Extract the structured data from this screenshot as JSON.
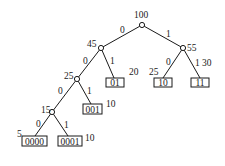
{
  "diagram": {
    "type": "huffman-tree",
    "nodes": [
      {
        "id": "root",
        "weight": "100"
      },
      {
        "id": "n45",
        "weight": "45"
      },
      {
        "id": "n55",
        "weight": "55"
      },
      {
        "id": "n25",
        "weight": "25"
      },
      {
        "id": "n15",
        "weight": "15"
      }
    ],
    "leaves": [
      {
        "code": "01",
        "weight": "20"
      },
      {
        "code": "10",
        "weight": "25"
      },
      {
        "code": "11",
        "weight": "30"
      },
      {
        "code": "001",
        "weight": "10"
      },
      {
        "code": "0000",
        "weight": "5"
      },
      {
        "code": "0001",
        "weight": "10"
      }
    ],
    "edge_labels": {
      "zero": "0",
      "one": "1"
    },
    "colors": {
      "line": "#1a1a1a",
      "background": "#ffffff"
    }
  }
}
